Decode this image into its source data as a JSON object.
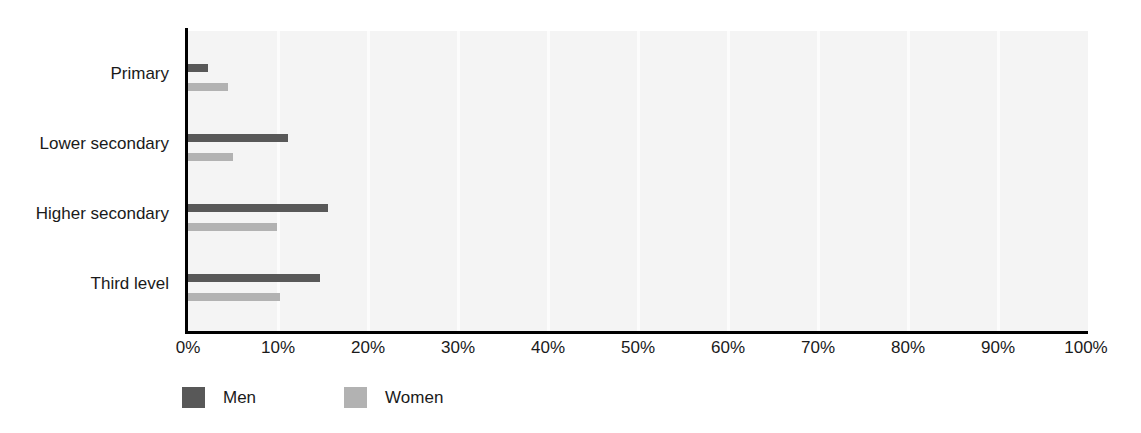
{
  "chart_data": {
    "type": "bar",
    "orientation": "horizontal",
    "title": "",
    "subtitle": "",
    "xlabel": "",
    "ylabel": "",
    "xlim": [
      0,
      100
    ],
    "grid": true,
    "legend_position": "bottom-left",
    "categories": [
      "Primary",
      "Lower secondary",
      "Higher secondary",
      "Third level"
    ],
    "tick_labels": [
      "0%",
      "10%",
      "20%",
      "30%",
      "40%",
      "50%",
      "60%",
      "70%",
      "80%",
      "90%",
      "100%"
    ],
    "tick_values": [
      0,
      10,
      20,
      30,
      40,
      50,
      60,
      70,
      80,
      90,
      100
    ],
    "series": [
      {
        "name": "Men",
        "color": "#585858",
        "values": [
          2.2,
          11.1,
          15.5,
          14.7
        ]
      },
      {
        "name": "Women",
        "color": "#b2b2b2",
        "values": [
          4.4,
          5.0,
          9.9,
          10.2
        ]
      }
    ]
  },
  "legend": {
    "items": [
      {
        "label": "Men",
        "swatch": "men-swatch"
      },
      {
        "label": "Women",
        "swatch": "women-swatch"
      }
    ]
  },
  "colors": {
    "men": "#585858",
    "women": "#b2b2b2",
    "plot_background": "#f4f4f4",
    "gridline": "#fcfcfc",
    "axis": "#000000",
    "text": "#1a1a1a",
    "page_background": "#ffffff"
  }
}
